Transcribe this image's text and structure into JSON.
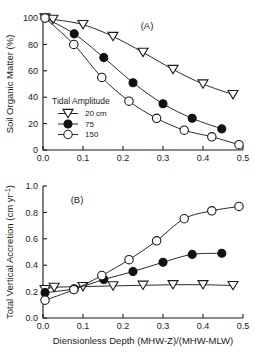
{
  "figure": {
    "panel_a_label": "(A)",
    "panel_b_label": "(B)"
  },
  "legend": {
    "title": "Tidal Amplitude",
    "entries": [
      {
        "label": "20 cm",
        "marker": "open-triangle-down-icon",
        "color": "#111111"
      },
      {
        "label": "75",
        "marker": "filled-circle-icon",
        "color": "#111111"
      },
      {
        "label": "150",
        "marker": "open-circle-icon",
        "color": "#111111"
      }
    ]
  },
  "axes": {
    "x_ticks": [
      "0.0",
      "0.1",
      "0.2",
      "0.3",
      "0.4",
      "0.5"
    ],
    "y_ticks_a": [
      "0",
      "20",
      "40",
      "60",
      "80",
      "100"
    ],
    "y_ticks_b": [
      "0.0",
      "0.2",
      "0.4",
      "0.6",
      "0.8",
      "1.0"
    ],
    "x_title": "Diensionless Depth (MHW-Z)/(MHW-MLW)",
    "y_title_a": "Soil Organic Matter (%)",
    "y_title_b": "Total Vertical Accretion (cm yr",
    "y_title_b_sup": "-1",
    "y_title_b_tail": ")"
  },
  "chart_data": [
    {
      "type": "line",
      "title": "(A)",
      "xlabel": "Diensionless Depth (MHW-Z)/(MHW-MLW)",
      "ylabel": "Soil Organic Matter (%)",
      "xlim": [
        0.0,
        0.5
      ],
      "ylim": [
        0,
        100
      ],
      "xticks": [
        0.0,
        0.1,
        0.2,
        0.3,
        0.4,
        0.5
      ],
      "yticks": [
        0,
        20,
        40,
        60,
        80,
        100
      ],
      "grid": false,
      "legend_position": "center-left",
      "legend_title": "Tidal Amplitude",
      "series": [
        {
          "name": "20 cm",
          "marker": "open-triangle-down",
          "x": [
            0.005,
            0.025,
            0.1,
            0.175,
            0.25,
            0.325,
            0.4,
            0.475
          ],
          "y": [
            100,
            99,
            95,
            86,
            74,
            61,
            50,
            42
          ]
        },
        {
          "name": "75",
          "marker": "filled-circle",
          "x": [
            0.005,
            0.078,
            0.152,
            0.225,
            0.3,
            0.373,
            0.447
          ],
          "y": [
            100,
            88,
            70,
            51,
            35,
            24,
            16
          ]
        },
        {
          "name": "150",
          "marker": "open-circle",
          "x": [
            0.005,
            0.077,
            0.147,
            0.215,
            0.284,
            0.353,
            0.422,
            0.49
          ],
          "y": [
            100,
            80,
            55,
            37,
            24,
            15,
            10,
            4
          ]
        }
      ]
    },
    {
      "type": "line",
      "title": "(B)",
      "xlabel": "Diensionless Depth (MHW-Z)/(MHW-MLW)",
      "ylabel": "Total Vertical Accretion (cm yr-1)",
      "xlim": [
        0.0,
        0.5
      ],
      "ylim": [
        0.0,
        1.0
      ],
      "xticks": [
        0.0,
        0.1,
        0.2,
        0.3,
        0.4,
        0.5
      ],
      "yticks": [
        0.0,
        0.2,
        0.4,
        0.6,
        0.8,
        1.0
      ],
      "grid": false,
      "legend_position": "none",
      "series": [
        {
          "name": "20 cm",
          "marker": "open-triangle-down",
          "x": [
            0.005,
            0.028,
            0.1,
            0.175,
            0.25,
            0.325,
            0.4,
            0.475
          ],
          "y": [
            0.215,
            0.232,
            0.238,
            0.243,
            0.248,
            0.252,
            0.252,
            0.246
          ]
        },
        {
          "name": "75",
          "marker": "filled-circle",
          "x": [
            0.005,
            0.078,
            0.152,
            0.225,
            0.3,
            0.373,
            0.447
          ],
          "y": [
            0.192,
            0.222,
            0.292,
            0.352,
            0.422,
            0.482,
            0.49
          ]
        },
        {
          "name": "150",
          "marker": "open-circle",
          "x": [
            0.005,
            0.077,
            0.147,
            0.215,
            0.284,
            0.353,
            0.422,
            0.49
          ],
          "y": [
            0.135,
            0.215,
            0.322,
            0.442,
            0.585,
            0.752,
            0.812,
            0.845
          ]
        }
      ]
    }
  ]
}
